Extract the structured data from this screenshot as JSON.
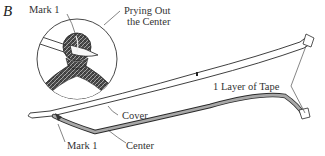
{
  "figure": {
    "label": "B"
  },
  "labels": {
    "mark1_top": "Mark 1",
    "prying_line1": "Prying Out",
    "prying_line2": "the Center",
    "tape": "1 Layer of Tape",
    "cover": "Cover",
    "mark1_bottom": "Mark 1",
    "center": "Center"
  },
  "colors": {
    "line": "#2a2a2a",
    "center_fill": "#9a9a9a",
    "texture": "#3a3a3a",
    "background": "#ffffff"
  }
}
